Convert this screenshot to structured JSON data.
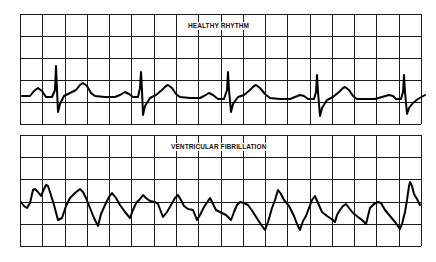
{
  "figure": {
    "panels": [
      {
        "id": "healthy",
        "title": "HEALTHY RHYTHM",
        "grid": {
          "x0": 20,
          "y0": 14,
          "x1": 421,
          "y1": 124,
          "cols": 18,
          "rows": 5
        },
        "title_pos": {
          "left": 187,
          "top": 22
        },
        "trace": [
          [
            22,
            96
          ],
          [
            30,
            96
          ],
          [
            34,
            91
          ],
          [
            38,
            88
          ],
          [
            42,
            91
          ],
          [
            46,
            97
          ],
          [
            52,
            97
          ],
          [
            55,
            90
          ],
          [
            56,
            66
          ],
          [
            57,
            90
          ],
          [
            58,
            112
          ],
          [
            60,
            104
          ],
          [
            64,
            96
          ],
          [
            70,
            93
          ],
          [
            76,
            90
          ],
          [
            80,
            85
          ],
          [
            83,
            83
          ],
          [
            87,
            86
          ],
          [
            91,
            93
          ],
          [
            95,
            96
          ],
          [
            105,
            97
          ],
          [
            115,
            97
          ],
          [
            120,
            95
          ],
          [
            125,
            92
          ],
          [
            129,
            94
          ],
          [
            133,
            97
          ],
          [
            138,
            97
          ],
          [
            140,
            88
          ],
          [
            141,
            72
          ],
          [
            142,
            90
          ],
          [
            143,
            115
          ],
          [
            145,
            106
          ],
          [
            150,
            98
          ],
          [
            156,
            95
          ],
          [
            162,
            90
          ],
          [
            166,
            86
          ],
          [
            168,
            85
          ],
          [
            172,
            88
          ],
          [
            176,
            94
          ],
          [
            180,
            97
          ],
          [
            190,
            98
          ],
          [
            200,
            98
          ],
          [
            204,
            96
          ],
          [
            209,
            93
          ],
          [
            213,
            95
          ],
          [
            218,
            99
          ],
          [
            224,
            99
          ],
          [
            227,
            90
          ],
          [
            228,
            72
          ],
          [
            229,
            90
          ],
          [
            231,
            112
          ],
          [
            233,
            104
          ],
          [
            238,
            97
          ],
          [
            244,
            95
          ],
          [
            250,
            90
          ],
          [
            254,
            86
          ],
          [
            256,
            85
          ],
          [
            260,
            88
          ],
          [
            265,
            94
          ],
          [
            270,
            98
          ],
          [
            280,
            99
          ],
          [
            290,
            99
          ],
          [
            295,
            97
          ],
          [
            300,
            95
          ],
          [
            304,
            96
          ],
          [
            308,
            99
          ],
          [
            314,
            99
          ],
          [
            316,
            92
          ],
          [
            317,
            75
          ],
          [
            318,
            92
          ],
          [
            320,
            116
          ],
          [
            322,
            108
          ],
          [
            327,
            100
          ],
          [
            333,
            97
          ],
          [
            339,
            92
          ],
          [
            343,
            88
          ],
          [
            345,
            87
          ],
          [
            349,
            90
          ],
          [
            353,
            96
          ],
          [
            357,
            99
          ],
          [
            367,
            99
          ],
          [
            375,
            99
          ],
          [
            382,
            97
          ],
          [
            389,
            95
          ],
          [
            393,
            96
          ],
          [
            396,
            99
          ],
          [
            401,
            99
          ],
          [
            403,
            92
          ],
          [
            404,
            75
          ],
          [
            405,
            92
          ],
          [
            407,
            114
          ],
          [
            409,
            108
          ],
          [
            413,
            103
          ],
          [
            418,
            99
          ],
          [
            425,
            95
          ]
        ]
      },
      {
        "id": "vfib",
        "title": "VENTRICULAR FIBRILLATION",
        "grid": {
          "x0": 20,
          "y0": 135,
          "x1": 421,
          "y1": 246,
          "cols": 18,
          "rows": 5
        },
        "title_pos": {
          "left": 170,
          "top": 143
        },
        "trace": [
          [
            21,
            202
          ],
          [
            24,
            206
          ],
          [
            27,
            208
          ],
          [
            30,
            203
          ],
          [
            33,
            190
          ],
          [
            35,
            189
          ],
          [
            38,
            192
          ],
          [
            41,
            196
          ],
          [
            44,
            189
          ],
          [
            46,
            185
          ],
          [
            48,
            186
          ],
          [
            50,
            192
          ],
          [
            54,
            205
          ],
          [
            58,
            220
          ],
          [
            62,
            218
          ],
          [
            66,
            206
          ],
          [
            70,
            198
          ],
          [
            75,
            193
          ],
          [
            80,
            189
          ],
          [
            83,
            192
          ],
          [
            86,
            198
          ],
          [
            90,
            208
          ],
          [
            94,
            218
          ],
          [
            98,
            226
          ],
          [
            101,
            214
          ],
          [
            105,
            205
          ],
          [
            109,
            197
          ],
          [
            112,
            193
          ],
          [
            116,
            198
          ],
          [
            120,
            205
          ],
          [
            125,
            212
          ],
          [
            130,
            218
          ],
          [
            133,
            210
          ],
          [
            136,
            203
          ],
          [
            140,
            199
          ],
          [
            143,
            195
          ],
          [
            146,
            198
          ],
          [
            150,
            201
          ],
          [
            155,
            202
          ],
          [
            158,
            204
          ],
          [
            163,
            217
          ],
          [
            167,
            212
          ],
          [
            171,
            205
          ],
          [
            175,
            198
          ],
          [
            178,
            195
          ],
          [
            181,
            200
          ],
          [
            184,
            206
          ],
          [
            188,
            209
          ],
          [
            193,
            210
          ],
          [
            197,
            220
          ],
          [
            200,
            215
          ],
          [
            204,
            207
          ],
          [
            208,
            201
          ],
          [
            210,
            198
          ],
          [
            213,
            204
          ],
          [
            216,
            210
          ],
          [
            222,
            213
          ],
          [
            226,
            215
          ],
          [
            231,
            220
          ],
          [
            234,
            212
          ],
          [
            237,
            205
          ],
          [
            240,
            202
          ],
          [
            244,
            203
          ],
          [
            248,
            205
          ],
          [
            253,
            212
          ],
          [
            258,
            220
          ],
          [
            262,
            226
          ],
          [
            265,
            230
          ],
          [
            268,
            222
          ],
          [
            272,
            208
          ],
          [
            275,
            200
          ],
          [
            278,
            190
          ],
          [
            281,
            194
          ],
          [
            284,
            200
          ],
          [
            289,
            206
          ],
          [
            294,
            216
          ],
          [
            297,
            224
          ],
          [
            300,
            230
          ],
          [
            303,
            221
          ],
          [
            306,
            216
          ],
          [
            309,
            208
          ],
          [
            312,
            200
          ],
          [
            315,
            196
          ],
          [
            318,
            203
          ],
          [
            322,
            212
          ],
          [
            327,
            216
          ],
          [
            333,
            220
          ],
          [
            335,
            222
          ],
          [
            337,
            215
          ],
          [
            340,
            210
          ],
          [
            343,
            206
          ],
          [
            346,
            204
          ],
          [
            349,
            208
          ],
          [
            353,
            213
          ],
          [
            358,
            217
          ],
          [
            362,
            220
          ],
          [
            366,
            224
          ],
          [
            368,
            216
          ],
          [
            370,
            208
          ],
          [
            374,
            204
          ],
          [
            378,
            202
          ],
          [
            381,
            203
          ],
          [
            385,
            210
          ],
          [
            390,
            216
          ],
          [
            395,
            222
          ],
          [
            400,
            229
          ],
          [
            402,
            224
          ],
          [
            405,
            212
          ],
          [
            407,
            200
          ],
          [
            409,
            186
          ],
          [
            410,
            182
          ],
          [
            412,
            186
          ],
          [
            414,
            194
          ],
          [
            417,
            199
          ],
          [
            420,
            205
          ]
        ]
      }
    ],
    "colors": {
      "grid": "#1a1a1a",
      "trace": "#000000",
      "background": "#ffffff"
    }
  }
}
